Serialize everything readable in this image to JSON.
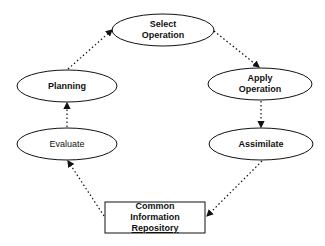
{
  "diagram": {
    "type": "cycle-flow",
    "nodes": [
      {
        "id": "select",
        "shape": "ellipse",
        "lines": [
          "Select",
          "Operation"
        ]
      },
      {
        "id": "apply",
        "shape": "ellipse",
        "lines": [
          "Apply",
          "Operation"
        ]
      },
      {
        "id": "assimilate",
        "shape": "ellipse",
        "lines": [
          "Assimilate"
        ]
      },
      {
        "id": "repository",
        "shape": "rectangle",
        "lines": [
          "Common",
          "Information",
          "Repository"
        ]
      },
      {
        "id": "evaluate",
        "shape": "ellipse",
        "lines": [
          "Evaluate"
        ]
      },
      {
        "id": "planning",
        "shape": "ellipse",
        "lines": [
          "Planning"
        ]
      }
    ],
    "edges": [
      {
        "from": "select",
        "to": "apply",
        "style": "dotted-arrow"
      },
      {
        "from": "apply",
        "to": "assimilate",
        "style": "dotted-arrow"
      },
      {
        "from": "assimilate",
        "to": "repository",
        "style": "dotted-arrow"
      },
      {
        "from": "repository",
        "to": "evaluate",
        "style": "dotted-arrow"
      },
      {
        "from": "evaluate",
        "to": "planning",
        "style": "dotted-arrow"
      },
      {
        "from": "planning",
        "to": "select",
        "style": "dotted-arrow"
      }
    ],
    "colors": {
      "stroke": "#111111",
      "background": "#ffffff"
    }
  }
}
